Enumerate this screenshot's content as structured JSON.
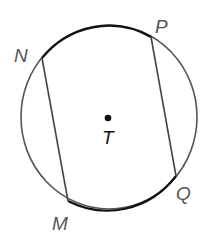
{
  "diagram": {
    "title": "",
    "circle": {
      "center_label": "T",
      "cx": 109,
      "cy": 117,
      "rx": 88,
      "ry": 92,
      "stroke_color": "#555555",
      "highlight_arc_color": "#111111"
    },
    "points": [
      {
        "id": "N",
        "label": "N",
        "x": 42,
        "y": 58,
        "label_x": 14,
        "label_y": 58
      },
      {
        "id": "P",
        "label": "P",
        "x": 151,
        "y": 37,
        "label_x": 155,
        "label_y": 30
      },
      {
        "id": "Q",
        "label": "Q",
        "x": 176,
        "y": 176,
        "label_x": 178,
        "label_y": 200
      },
      {
        "id": "M",
        "label": "M",
        "x": 68,
        "y": 201,
        "label_x": 52,
        "label_y": 230
      }
    ],
    "chords": [
      {
        "from": "N",
        "to": "M"
      },
      {
        "from": "P",
        "to": "Q"
      }
    ],
    "highlighted_arcs": [
      {
        "from": "N",
        "to": "P"
      },
      {
        "from": "M",
        "to": "Q"
      }
    ],
    "center_point": {
      "label": "T",
      "x": 108,
      "y": 118
    }
  }
}
